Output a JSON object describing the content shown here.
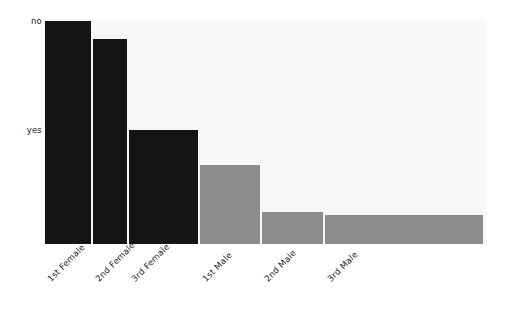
{
  "chart_data": {
    "type": "bar",
    "plot_kind": "mosaic",
    "title": "",
    "subtitle": "",
    "xlabel": "",
    "ylabel": "",
    "grid": false,
    "legend_position": "none",
    "annotations": [],
    "y_categories": [
      "no",
      "yes"
    ],
    "y_tick_labels": [
      "no",
      "yes"
    ],
    "categories": [
      "1st Female",
      "2nd Female",
      "3rd Female",
      "1st Male",
      "2nd Male",
      "3rd Male"
    ],
    "series": [
      {
        "name": "no",
        "color": "#f7f7f7",
        "values": [
          0.0,
          0.079,
          0.49,
          0.646,
          0.858,
          0.872
        ]
      },
      {
        "name": "yes",
        "color": "#141414",
        "values": [
          1.0,
          0.921,
          0.51,
          0.354,
          0.142,
          0.128
        ]
      }
    ],
    "column_widths": [
      0.107,
      0.079,
      0.159,
      0.141,
      0.141,
      0.367
    ],
    "ylim": [
      0,
      1
    ],
    "columns": [
      {
        "label": "1st Female",
        "sex": "Female",
        "class": "1st",
        "width_fraction": 0.107,
        "yes_fraction": 1.0,
        "no_fraction": 0.0,
        "fill": "#141414"
      },
      {
        "label": "2nd Female",
        "sex": "Female",
        "class": "2nd",
        "width_fraction": 0.079,
        "yes_fraction": 0.921,
        "no_fraction": 0.079,
        "fill": "#141414"
      },
      {
        "label": "3rd Female",
        "sex": "Female",
        "class": "3rd",
        "width_fraction": 0.159,
        "yes_fraction": 0.51,
        "no_fraction": 0.49,
        "fill": "#141414"
      },
      {
        "label": "1st Male",
        "sex": "Male",
        "class": "1st",
        "width_fraction": 0.141,
        "yes_fraction": 0.354,
        "no_fraction": 0.646,
        "fill": "#8c8c8c"
      },
      {
        "label": "2nd Male",
        "sex": "Male",
        "class": "2nd",
        "width_fraction": 0.141,
        "yes_fraction": 0.142,
        "no_fraction": 0.858,
        "fill": "#8c8c8c"
      },
      {
        "label": "3rd Male",
        "sex": "Male",
        "class": "3rd",
        "width_fraction": 0.367,
        "yes_fraction": 0.128,
        "no_fraction": 0.872,
        "fill": "#8c8c8c"
      }
    ]
  },
  "style": {
    "background": "#ffffff",
    "panel_background": "#f7f7f7",
    "dark_fill": "#141414",
    "gray_fill": "#8c8c8c",
    "light_fill": "#f7f7f7",
    "text_color": "#1a1a1a",
    "gap_px": 2,
    "label_rotation_deg": -45
  },
  "geometry": {
    "plot_left": 45,
    "plot_top": 21,
    "plot_width": 441,
    "plot_height": 223
  }
}
